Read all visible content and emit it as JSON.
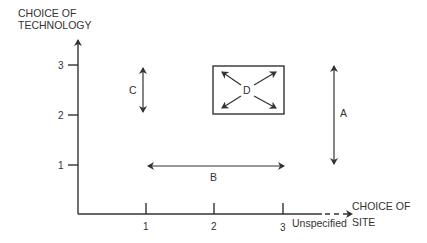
{
  "diagram": {
    "y_axis": {
      "title_line1": "CHOICE OF",
      "title_line2": "TECHNOLOGY",
      "ticks": [
        "1",
        "2",
        "3"
      ]
    },
    "x_axis": {
      "title_line1": "CHOICE OF",
      "title_line2": "SITE",
      "ticks": [
        "1",
        "2",
        "3"
      ],
      "extension_label": "Unspecified"
    },
    "arrows": {
      "A": {
        "label": "A",
        "direction": "vertical"
      },
      "B": {
        "label": "B",
        "direction": "horizontal"
      },
      "C": {
        "label": "C",
        "direction": "vertical"
      },
      "D": {
        "label": "D",
        "direction": "diagonal-in-box"
      }
    },
    "colors": {
      "stroke": "#333333",
      "background": "#ffffff"
    }
  }
}
